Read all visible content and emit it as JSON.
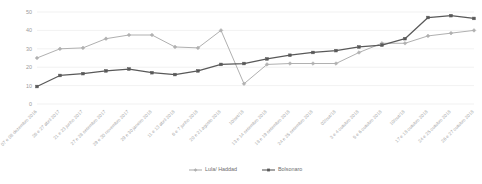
{
  "chart_data": {
    "type": "line",
    "title": "",
    "subtitle": "",
    "xlabel": "",
    "ylabel": "",
    "ylim": [
      0,
      50
    ],
    "yticks": [
      0,
      10,
      20,
      30,
      40,
      50
    ],
    "grid": true,
    "legend_position": "bottom",
    "categories": [
      "07 e 08 dezembro 2016",
      "26 e 27 abril 2017",
      "21 e 23 junho 2017",
      "27 e 28 setembro 2017",
      "29 e 30 novembro 2017",
      "29 e 30 janeiro 2018",
      "11 e 13 abril 2018",
      "6 e 7 junho 2018",
      "20 e 21 agosto 2018",
      "10/set/18",
      "13 e 14 setembro 2018",
      "18 e 19 setembro 2018",
      "24 e 25 setembro 2018",
      "02/out/18",
      "3 e 4 outubro 2018",
      "5 e 6 outubro 2018",
      "10/out/18",
      "17 e 18 outubro 2018",
      "24 e 25 outubro 2018",
      "26 e 27 outubro 2018"
    ],
    "series": [
      {
        "name": "Lula/ Haddad",
        "color": "#b0b0b0",
        "marker": "diamond",
        "values": [
          25,
          30,
          30.5,
          35.5,
          37.5,
          37.5,
          31,
          30.5,
          40,
          11,
          21.5,
          22,
          22,
          22,
          28,
          33,
          33,
          37,
          38.5,
          40
        ]
      },
      {
        "name": "Bolsonaro",
        "color": "#595959",
        "marker": "square",
        "values": [
          9.5,
          15.5,
          16.5,
          18,
          19,
          17,
          16,
          18,
          21.5,
          22,
          24.5,
          26.5,
          28,
          29,
          31,
          32,
          35.5,
          47,
          48,
          46.5
        ]
      }
    ]
  },
  "legend": {
    "items": [
      {
        "label": "Lula/ Haddad",
        "color": "#b0b0b0"
      },
      {
        "label": "Bolsonaro",
        "color": "#595959"
      }
    ]
  }
}
